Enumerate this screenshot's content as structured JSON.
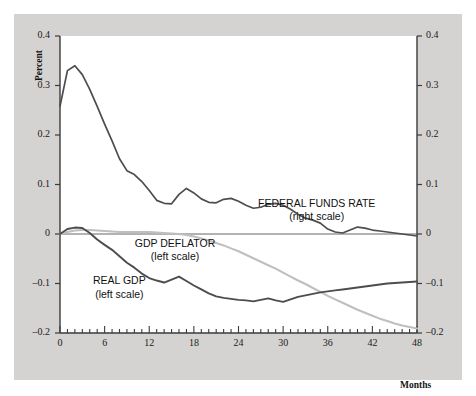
{
  "figure": {
    "panel_bg": "#d5d3d1",
    "plot_bg": "#ffffff",
    "axis_color": "#3b3b3b"
  },
  "chart_data": {
    "type": "line",
    "title": "",
    "subtitle": "",
    "xlabel": "Months",
    "ylabel_left": "Percent",
    "ylabel_right": "Percentage points",
    "grid": false,
    "legend_position": "inline-annotations",
    "xlim": [
      0,
      48
    ],
    "ylim": [
      -0.2,
      0.4
    ],
    "ylim_right": [
      -0.2,
      0.4
    ],
    "xticks": [
      0,
      6,
      12,
      18,
      24,
      30,
      36,
      42,
      48
    ],
    "xtick_labels": [
      "0",
      "6",
      "12",
      "18",
      "24",
      "30",
      "36",
      "42",
      "48"
    ],
    "xminor_tick_interval": 1,
    "yticks": [
      -0.2,
      -0.1,
      0,
      0.1,
      0.2,
      0.3,
      0.4
    ],
    "ytick_labels_left": [
      "-0.2",
      "-0.1",
      "0",
      "0.1",
      "0.2",
      "0.3",
      "0.4"
    ],
    "ytick_labels_right": [
      "-0.2",
      "-0.1",
      "0",
      "0.1",
      "0.2",
      "0.3",
      "0.4"
    ],
    "zero_line": 0,
    "annotations": [
      {
        "name": "federal-funds-rate",
        "text": "FEDERAL FUNDS RATE",
        "subtext": "(right scale)",
        "x": 34.5,
        "y": 0.048
      },
      {
        "name": "gdp-deflator",
        "text": "GDP DEFLATOR",
        "subtext": "(left scale)",
        "x": 15.5,
        "y": -0.033
      },
      {
        "name": "real-gdp",
        "text": "REAL GDP",
        "subtext": "(left scale)",
        "x": 8.0,
        "y": -0.108
      }
    ],
    "series": [
      {
        "name": "FEDERAL FUNDS RATE",
        "scale": "right",
        "color": "#4d4d4d",
        "width": 1.7,
        "x": [
          0,
          1,
          2,
          3,
          4,
          5,
          6,
          7,
          8,
          9,
          10,
          11,
          12,
          13,
          14,
          15,
          16,
          17,
          18,
          19,
          20,
          21,
          22,
          23,
          24,
          25,
          26,
          27,
          28,
          29,
          30,
          31,
          32,
          33,
          34,
          35,
          36,
          37,
          38,
          39,
          40,
          41,
          42,
          43,
          44,
          45,
          46,
          47,
          48
        ],
        "values": [
          0.258,
          0.33,
          0.34,
          0.322,
          0.292,
          0.258,
          0.222,
          0.188,
          0.152,
          0.128,
          0.12,
          0.106,
          0.088,
          0.068,
          0.062,
          0.061,
          0.08,
          0.092,
          0.083,
          0.071,
          0.064,
          0.063,
          0.07,
          0.072,
          0.066,
          0.058,
          0.052,
          0.054,
          0.06,
          0.062,
          0.058,
          0.05,
          0.04,
          0.032,
          0.028,
          0.022,
          0.01,
          0.004,
          0.002,
          0.008,
          0.014,
          0.012,
          0.008,
          0.006,
          0.004,
          0.002,
          0.0,
          -0.002,
          -0.004
        ]
      },
      {
        "name": "GDP DEFLATOR",
        "scale": "left",
        "color": "#bfbfbf",
        "width": 2.1,
        "x": [
          0,
          1,
          2,
          3,
          4,
          5,
          6,
          7,
          8,
          9,
          10,
          11,
          12,
          13,
          14,
          15,
          16,
          17,
          18,
          19,
          20,
          21,
          22,
          23,
          24,
          25,
          26,
          27,
          28,
          29,
          30,
          31,
          32,
          33,
          34,
          35,
          36,
          37,
          38,
          39,
          40,
          41,
          42,
          43,
          44,
          45,
          46,
          47,
          48
        ],
        "values": [
          0.0,
          0.004,
          0.007,
          0.008,
          0.008,
          0.007,
          0.006,
          0.005,
          0.004,
          0.004,
          0.004,
          0.004,
          0.004,
          0.003,
          0.002,
          0.001,
          0.0,
          -0.002,
          -0.005,
          -0.009,
          -0.013,
          -0.018,
          -0.023,
          -0.029,
          -0.035,
          -0.042,
          -0.049,
          -0.056,
          -0.063,
          -0.07,
          -0.078,
          -0.086,
          -0.094,
          -0.101,
          -0.109,
          -0.117,
          -0.125,
          -0.132,
          -0.139,
          -0.146,
          -0.153,
          -0.159,
          -0.165,
          -0.171,
          -0.176,
          -0.181,
          -0.185,
          -0.188,
          -0.191
        ]
      },
      {
        "name": "REAL GDP",
        "scale": "left",
        "color": "#4d4d4d",
        "width": 1.9,
        "x": [
          0,
          1,
          2,
          3,
          4,
          5,
          6,
          7,
          8,
          9,
          10,
          11,
          12,
          13,
          14,
          15,
          16,
          17,
          18,
          19,
          20,
          21,
          22,
          23,
          24,
          25,
          26,
          27,
          28,
          29,
          30,
          31,
          32,
          33,
          34,
          35,
          36,
          37,
          38,
          39,
          40,
          41,
          42,
          43,
          44,
          45,
          46,
          47,
          48
        ],
        "values": [
          0.0,
          0.01,
          0.013,
          0.012,
          0.002,
          -0.011,
          -0.022,
          -0.032,
          -0.045,
          -0.058,
          -0.068,
          -0.08,
          -0.089,
          -0.094,
          -0.098,
          -0.092,
          -0.086,
          -0.095,
          -0.104,
          -0.112,
          -0.12,
          -0.126,
          -0.129,
          -0.131,
          -0.133,
          -0.134,
          -0.136,
          -0.133,
          -0.13,
          -0.134,
          -0.137,
          -0.132,
          -0.127,
          -0.124,
          -0.121,
          -0.118,
          -0.116,
          -0.114,
          -0.112,
          -0.11,
          -0.108,
          -0.106,
          -0.104,
          -0.102,
          -0.1,
          -0.099,
          -0.098,
          -0.097,
          -0.096
        ]
      }
    ]
  }
}
